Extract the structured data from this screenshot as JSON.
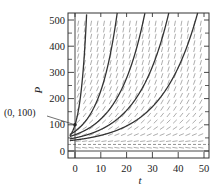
{
  "chart_data": {
    "type": "line",
    "subtype": "direction-field-with-solution-curves",
    "title": "",
    "xlabel": "t",
    "ylabel": "P",
    "xlim": [
      -2,
      51
    ],
    "ylim": [
      -25,
      525
    ],
    "x_ticks": [
      0,
      10,
      20,
      30,
      40,
      50
    ],
    "y_ticks": [
      0,
      100,
      200,
      300,
      400,
      500
    ],
    "y_minor_ticks": [
      50,
      150,
      250,
      350,
      450
    ],
    "grid": false,
    "legend": null,
    "equilibrium_P": 25,
    "direction_field": {
      "t_spacing": 2.5,
      "P_spacing": 25,
      "style": "dashed short segments"
    },
    "annotation": {
      "text": "(0, 100)",
      "point": [
        0,
        100
      ]
    },
    "series": [
      {
        "name": "solution through (0,100)",
        "P0": 100,
        "k": 0.42
      },
      {
        "name": "solution P0=75",
        "P0": 75,
        "k": 0.141
      },
      {
        "name": "solution P0=62",
        "P0": 62,
        "k": 0.0962
      },
      {
        "name": "solution P0=50",
        "P0": 50,
        "k": 0.0825
      },
      {
        "name": "solution P0=42",
        "P0": 42,
        "k": 0.0712
      }
    ],
    "model": "P(t) = 25 + (P0 - 25) * exp(k t)"
  }
}
